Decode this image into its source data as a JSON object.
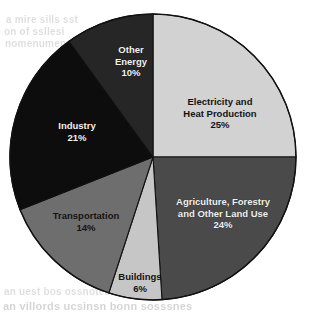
{
  "background_artifacts": {
    "note": "faint scanner bleed-through text, illegible",
    "top_left": [
      "a mire sills sst",
      "on of ssllesi",
      "nomenumenos"
    ],
    "bottom_left": [
      "an uest bos ossnotess ossens",
      "an villords ucsinsn bonn sosssnes"
    ]
  },
  "chart_data": {
    "type": "pie",
    "title": "",
    "legend_position": "none",
    "labels_inside_slices": true,
    "start_angle_deg": 0,
    "direction": "clockwise",
    "categories": [
      "Electricity and Heat Production",
      "Agriculture, Forestry and Other Land Use",
      "Buildings",
      "Transportation",
      "Industry",
      "Other Energy"
    ],
    "values": [
      25,
      24,
      6,
      14,
      21,
      10
    ],
    "value_unit": "%",
    "slices": [
      {
        "name": "electricity",
        "label_line1": "Electricity and",
        "label_line2": "Heat Production",
        "value_label": "25%",
        "value": 25,
        "color": "#d2d2d2",
        "text_tone": "on-light"
      },
      {
        "name": "agriculture",
        "label_line1": "Agriculture, Forestry",
        "label_line2": "and Other Land Use",
        "value_label": "24%",
        "value": 24,
        "color": "#4a4a4a",
        "text_tone": "on-dark"
      },
      {
        "name": "buildings",
        "label_line1": "Buildings",
        "label_line2": "",
        "value_label": "6%",
        "value": 6,
        "color": "#c6c6c6",
        "text_tone": "on-light"
      },
      {
        "name": "transportation",
        "label_line1": "Transportation",
        "label_line2": "",
        "value_label": "14%",
        "value": 14,
        "color": "#6e6e6e",
        "text_tone": "on-light"
      },
      {
        "name": "industry",
        "label_line1": "Industry",
        "label_line2": "",
        "value_label": "21%",
        "value": 21,
        "color": "#0d0d0d",
        "text_tone": "on-dark"
      },
      {
        "name": "other-energy",
        "label_line1": "Other",
        "label_line2": "Energy",
        "value_label": "10%",
        "value": 10,
        "color": "#262626",
        "text_tone": "on-dark"
      }
    ],
    "geometry": {
      "center_x": 153,
      "center_y": 157,
      "radius": 143,
      "outline_color": "#111111"
    }
  }
}
